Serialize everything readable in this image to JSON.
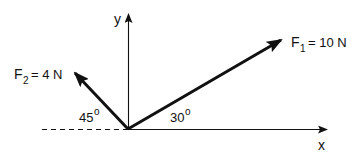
{
  "diagram": {
    "type": "force-vector-diagram",
    "axes": {
      "x_label": "x",
      "y_label": "y"
    },
    "forces": [
      {
        "name": "F1",
        "symbol": "F",
        "subscript": "1",
        "equals": "= 10 N",
        "magnitude": 10,
        "unit": "N",
        "angle_label": "30",
        "angle_deg": 30,
        "angle_reference": "positive x-axis"
      },
      {
        "name": "F2",
        "symbol": "F",
        "subscript": "2",
        "equals": "= 4 N",
        "magnitude": 4,
        "unit": "N",
        "angle_label": "45",
        "angle_deg": 45,
        "angle_reference": "negative x-axis"
      }
    ],
    "degree_symbol": "o",
    "colors": {
      "stroke": "#111111",
      "background": "#ffffff"
    }
  }
}
